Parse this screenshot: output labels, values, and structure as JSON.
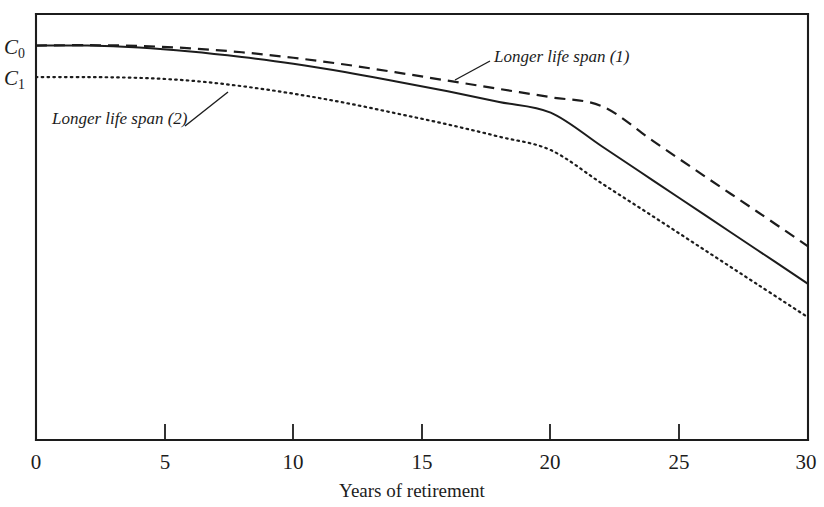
{
  "chart_data": {
    "type": "line",
    "title": "",
    "xlabel": "Years of retirement",
    "ylabel": "",
    "xlim": [
      0,
      30
    ],
    "ylim": [
      0,
      1.08
    ],
    "grid": false,
    "legend_position": "inline-annotations",
    "xticks": [
      "0",
      "5",
      "10",
      "15",
      "20",
      "25",
      "30"
    ],
    "xtick_values": [
      0,
      5,
      10,
      15,
      20,
      25,
      30
    ],
    "yticks": [
      "C0",
      "C1"
    ],
    "ytick_labels": [
      {
        "base": "C",
        "sub": "0",
        "value": 1.0
      },
      {
        "base": "C",
        "sub": "1",
        "value": 0.92
      }
    ],
    "series": [
      {
        "name": "Baseline consumption path",
        "style": "solid",
        "annotation": "",
        "x": [
          0,
          2,
          4,
          6,
          8,
          10,
          12,
          14,
          16,
          18,
          20,
          22,
          24,
          26,
          28,
          30
        ],
        "y": [
          1.0,
          1.0,
          0.995,
          0.985,
          0.971,
          0.954,
          0.933,
          0.909,
          0.884,
          0.857,
          0.83,
          0.744,
          0.657,
          0.57,
          0.483,
          0.396
        ]
      },
      {
        "name": "Longer life span (1)",
        "style": "dashed",
        "annotation": "Longer life span (1)",
        "x": [
          0,
          2,
          4,
          6,
          8,
          10,
          12,
          14,
          16,
          18,
          20,
          22,
          24,
          26,
          28,
          30
        ],
        "y": [
          1.0,
          1.001,
          0.999,
          0.993,
          0.983,
          0.969,
          0.952,
          0.932,
          0.911,
          0.89,
          0.869,
          0.846,
          0.757,
          0.668,
          0.58,
          0.491
        ]
      },
      {
        "name": "Longer life span (2)",
        "style": "dotted",
        "annotation": "Longer life span (2)",
        "x": [
          0,
          2,
          4,
          6,
          8,
          10,
          12,
          14,
          16,
          18,
          20,
          22,
          24,
          26,
          28,
          30
        ],
        "y": [
          0.92,
          0.92,
          0.918,
          0.911,
          0.897,
          0.878,
          0.855,
          0.828,
          0.8,
          0.769,
          0.735,
          0.65,
          0.566,
          0.481,
          0.396,
          0.311
        ]
      }
    ],
    "annotations": [
      {
        "text": "Longer life span (1)",
        "x": 18.1,
        "y": 0.945
      },
      {
        "text": "Longer life span (2)",
        "x": 2.5,
        "y": 0.775
      }
    ]
  },
  "axis": {
    "x_title": "Years of retirement",
    "tick_0": "0",
    "tick_5": "5",
    "tick_10": "10",
    "tick_15": "15",
    "tick_20": "20",
    "tick_25": "25",
    "tick_30": "30"
  },
  "ylabels": {
    "c0_base": "C",
    "c0_sub": "0",
    "c1_base": "C",
    "c1_sub": "1"
  },
  "annotations": {
    "label1": "Longer life span (1)",
    "label2": "Longer life span (2)"
  },
  "colors": {
    "ink": "#1c1c1c",
    "background": "#ffffff"
  }
}
